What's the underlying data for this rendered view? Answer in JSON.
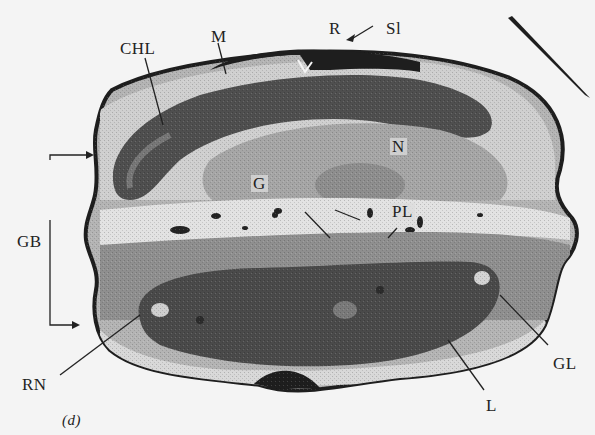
{
  "figure": {
    "panel_label": "(d)",
    "labels": {
      "chl": "CHL",
      "m": "M",
      "r": "R",
      "sl": "Sl",
      "n": "N",
      "g": "G",
      "pl": "PL",
      "gb": "GB",
      "rn": "RN",
      "gl": "GL",
      "l": "L"
    },
    "colors": {
      "background": "#f4f4f4",
      "cell_wall": "#1e1e1e",
      "cytoplasm": "#9a9a9a",
      "chloroplast": "#555555",
      "light_zone": "#dadada",
      "nucleus": "#a8a8a8"
    }
  }
}
